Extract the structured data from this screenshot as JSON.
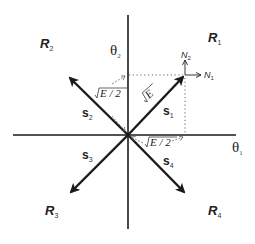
{
  "diagram": {
    "axes": {
      "horizontal": {
        "symbol": "θ",
        "subscript": "1"
      },
      "vertical": {
        "symbol": "θ",
        "subscript": "2"
      }
    },
    "regions": [
      {
        "id": "R1",
        "letter": "R",
        "subscript": "1",
        "quadrant": "upper-right"
      },
      {
        "id": "R2",
        "letter": "R",
        "subscript": "2",
        "quadrant": "upper-left"
      },
      {
        "id": "R3",
        "letter": "R",
        "subscript": "3",
        "quadrant": "lower-left"
      },
      {
        "id": "R4",
        "letter": "R",
        "subscript": "4",
        "quadrant": "lower-right"
      }
    ],
    "signals": [
      {
        "id": "s1",
        "letter": "s",
        "subscript": "1",
        "direction": "upper-right"
      },
      {
        "id": "s2",
        "letter": "s",
        "subscript": "2",
        "direction": "upper-left"
      },
      {
        "id": "s3",
        "letter": "s",
        "subscript": "3",
        "direction": "lower-left"
      },
      {
        "id": "s4",
        "letter": "s",
        "subscript": "4",
        "direction": "lower-right"
      }
    ],
    "magnitudes": {
      "signal_length": "√E",
      "projection_vertical": "√E / 2",
      "projection_horizontal": "√E / 2"
    },
    "noise_components": [
      {
        "id": "N1",
        "letter": "N",
        "subscript": "1",
        "direction": "horizontal"
      },
      {
        "id": "N2",
        "letter": "N",
        "subscript": "2",
        "direction": "vertical"
      }
    ],
    "colors": {
      "stroke": "#1a1a1a",
      "dotted": "#555555",
      "background": "#ffffff"
    }
  }
}
